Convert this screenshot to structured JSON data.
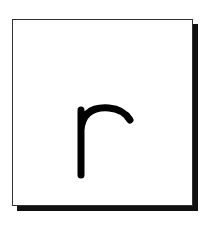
{
  "card": {
    "letter": "r",
    "border_color": "#333333",
    "shadow_color": "#111111",
    "letter_color": "#000000"
  }
}
